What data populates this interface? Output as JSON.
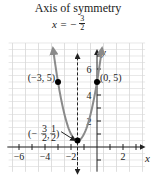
{
  "title": "Axis of symmetry",
  "axis_equation": {
    "lhs": "x = −",
    "num": "3",
    "den": "2"
  },
  "axis_labels": {
    "x": "x",
    "y": "y"
  },
  "colors": {
    "curve": "#8a8a8a",
    "grid": "#d8d8d8",
    "axis": "#222222",
    "point": "#000000"
  },
  "chart_data": {
    "type": "line",
    "title": "Axis of symmetry",
    "function": "y = 2x^2 + 6x + 5",
    "xlabel": "x",
    "ylabel": "y",
    "xlim": [
      -7,
      4
    ],
    "ylim": [
      -2,
      8
    ],
    "x_ticks": [
      -6,
      -4,
      -2,
      2
    ],
    "x_tick_labels": [
      "−6",
      "−4",
      "−2",
      "2"
    ],
    "y_ticks": [
      2,
      4,
      6
    ],
    "y_tick_labels": [
      "2",
      "4",
      "6"
    ],
    "grid": true,
    "axis_of_symmetry": -1.5,
    "points": [
      {
        "x": -3,
        "y": 5,
        "label": "(−3, 5)"
      },
      {
        "x": 0,
        "y": 5,
        "label": "(0, 5)"
      },
      {
        "x": -1.5,
        "y": 0.5,
        "label": "(−3/2, 1/2)"
      }
    ]
  }
}
